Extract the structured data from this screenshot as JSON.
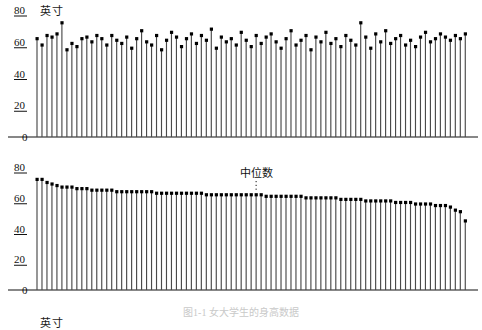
{
  "figure": {
    "caption": "图1-1  女大学生的身高数据",
    "unit_label": "英寸"
  },
  "panels": [
    {
      "id": "unsorted",
      "unit_label": "英寸",
      "y_ticks": [
        "0",
        "20",
        "40",
        "60",
        "80"
      ],
      "median_label": null
    },
    {
      "id": "sorted",
      "unit_label": "英寸",
      "y_ticks": [
        "0",
        "20",
        "40",
        "60",
        "80"
      ],
      "median_label": "中位数"
    }
  ],
  "chart_data": [
    {
      "type": "line",
      "subtype": "stem",
      "id": "unsorted-heights",
      "title": "",
      "xlabel": "",
      "ylabel": "英寸",
      "ylim": [
        0,
        80
      ],
      "yticks": [
        0,
        20,
        40,
        60,
        80
      ],
      "grid": false,
      "legend": "none",
      "marker": "filled-square-dot",
      "baseline": 0,
      "x": [
        1,
        2,
        3,
        4,
        5,
        6,
        7,
        8,
        9,
        10,
        11,
        12,
        13,
        14,
        15,
        16,
        17,
        18,
        19,
        20,
        21,
        22,
        23,
        24,
        25,
        26,
        27,
        28,
        29,
        30,
        31,
        32,
        33,
        34,
        35,
        36,
        37,
        38,
        39,
        40,
        41,
        42,
        43,
        44,
        45,
        46,
        47,
        48,
        49,
        50,
        51,
        52,
        53,
        54,
        55,
        56,
        57,
        58,
        59,
        60,
        61,
        62,
        63,
        64,
        65,
        66,
        67,
        68,
        69,
        70,
        71,
        72,
        73,
        74,
        75,
        76,
        77,
        78,
        79,
        80,
        81,
        82,
        83,
        84,
        85,
        86,
        87
      ],
      "values": [
        62,
        58,
        64,
        63,
        65,
        72,
        55,
        59,
        57,
        62,
        63,
        60,
        64,
        62,
        58,
        64,
        61,
        59,
        63,
        56,
        62,
        67,
        60,
        58,
        64,
        55,
        61,
        66,
        63,
        57,
        62,
        65,
        59,
        64,
        61,
        68,
        56,
        63,
        60,
        62,
        58,
        66,
        61,
        57,
        64,
        59,
        63,
        65,
        60,
        56,
        62,
        67,
        58,
        61,
        64,
        55,
        63,
        60,
        66,
        59,
        62,
        57,
        64,
        61,
        58,
        72,
        63,
        56,
        65,
        60,
        67,
        59,
        62,
        64,
        58,
        61,
        57,
        63,
        66,
        60,
        62,
        65,
        63,
        61,
        64,
        62,
        65
      ]
    },
    {
      "type": "line",
      "subtype": "stem",
      "id": "sorted-heights",
      "title": "",
      "xlabel": "",
      "ylabel": "英寸",
      "ylim": [
        0,
        80
      ],
      "yticks": [
        0,
        20,
        40,
        60,
        80
      ],
      "grid": false,
      "legend": "none",
      "marker": "filled-square-dot",
      "baseline": 0,
      "annotation": {
        "text": "中位数",
        "at_index": 44,
        "value": 62
      },
      "x": [
        1,
        2,
        3,
        4,
        5,
        6,
        7,
        8,
        9,
        10,
        11,
        12,
        13,
        14,
        15,
        16,
        17,
        18,
        19,
        20,
        21,
        22,
        23,
        24,
        25,
        26,
        27,
        28,
        29,
        30,
        31,
        32,
        33,
        34,
        35,
        36,
        37,
        38,
        39,
        40,
        41,
        42,
        43,
        44,
        45,
        46,
        47,
        48,
        49,
        50,
        51,
        52,
        53,
        54,
        55,
        56,
        57,
        58,
        59,
        60,
        61,
        62,
        63,
        64,
        65,
        66,
        67,
        68,
        69,
        70,
        71,
        72,
        73,
        74,
        75,
        76,
        77,
        78,
        79,
        80,
        81,
        82,
        83,
        84,
        85,
        86,
        87
      ],
      "values": [
        72,
        72,
        70,
        69,
        68,
        67,
        67,
        67,
        66,
        66,
        66,
        65,
        65,
        65,
        65,
        65,
        64,
        64,
        64,
        64,
        64,
        64,
        64,
        64,
        63,
        63,
        63,
        63,
        63,
        63,
        63,
        63,
        63,
        63,
        62,
        62,
        62,
        62,
        62,
        62,
        62,
        62,
        62,
        62,
        62,
        62,
        61,
        61,
        61,
        61,
        61,
        61,
        61,
        61,
        60,
        60,
        60,
        60,
        60,
        60,
        60,
        59,
        59,
        59,
        59,
        59,
        58,
        58,
        58,
        58,
        58,
        58,
        57,
        57,
        57,
        57,
        56,
        56,
        56,
        56,
        55,
        55,
        55,
        54,
        52,
        51,
        45
      ]
    }
  ]
}
